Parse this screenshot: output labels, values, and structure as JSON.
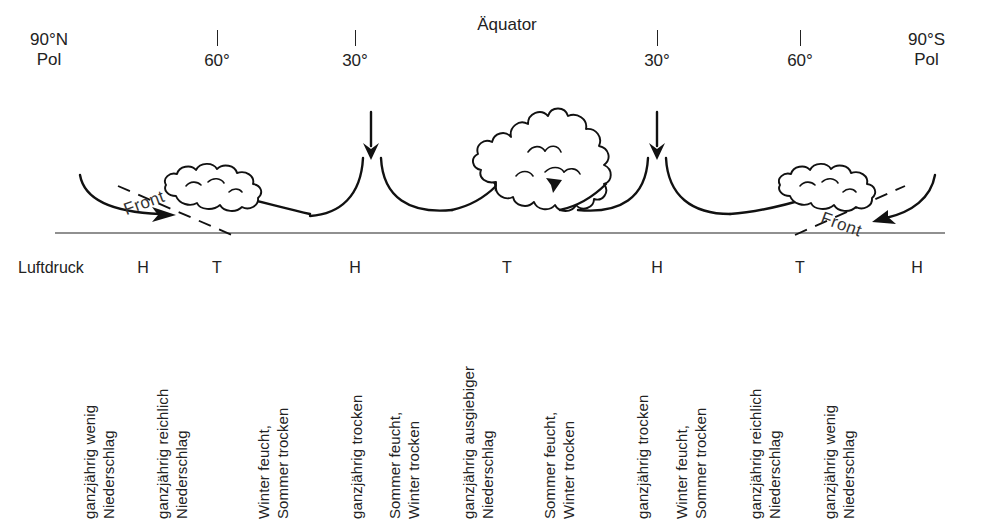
{
  "figure": {
    "equator_label": "Äquator",
    "pressure_caption": "Luftdruck",
    "front_label_left": "Front",
    "front_label_right": "Front"
  },
  "latitude_scale": {
    "left_pole": "90°N\nPol",
    "right_pole": "90°S\nPol",
    "ticks": [
      {
        "label": "60°",
        "x": 217
      },
      {
        "label": "30°",
        "x": 355
      },
      {
        "label": "30°",
        "x": 657
      },
      {
        "label": "60°",
        "x": 800
      }
    ]
  },
  "pressure_belts": [
    {
      "symbol": "H",
      "x": 143
    },
    {
      "symbol": "T",
      "x": 217
    },
    {
      "symbol": "H",
      "x": 355
    },
    {
      "symbol": "T",
      "x": 507
    },
    {
      "symbol": "H",
      "x": 657
    },
    {
      "symbol": "T",
      "x": 800
    },
    {
      "symbol": "H",
      "x": 917
    }
  ],
  "precipitation_regimes": [
    {
      "x": 118,
      "text": "ganzjährig wenig\nNiederschlag"
    },
    {
      "x": 191,
      "text": "ganzjährig reichlich\nNiederschlag"
    },
    {
      "x": 292,
      "text": "Winter feucht,\nSommer trocken"
    },
    {
      "x": 366,
      "text": "ganzjährig trocken"
    },
    {
      "x": 423,
      "text": "Sommer feucht,\nWinter trocken"
    },
    {
      "x": 497,
      "text": "ganzjährig ausgiebiger\nNiederschlag"
    },
    {
      "x": 578,
      "text": "Sommer feucht,\nWinter trocken"
    },
    {
      "x": 652,
      "text": "ganzjährig trocken"
    },
    {
      "x": 710,
      "text": "Winter feucht,\nSommer trocken"
    },
    {
      "x": 784,
      "text": "ganzjährig reichlich\nNiederschlag"
    },
    {
      "x": 858,
      "text": "ganzjährig wenig\nNiederschlag"
    }
  ],
  "colors": {
    "ink": "#111111",
    "ground": "#6b6b6b",
    "text": "#222222",
    "background": "#ffffff"
  }
}
